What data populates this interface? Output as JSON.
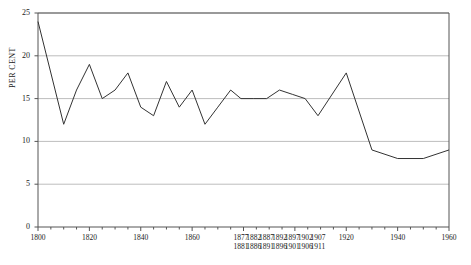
{
  "chart_data": {
    "type": "line",
    "title": "",
    "xlabel": "",
    "ylabel": "PER CENT",
    "ylim": [
      0,
      25
    ],
    "xlim": [
      1800,
      1960
    ],
    "grid": true,
    "legend": "none",
    "y_ticks": [
      0,
      5,
      10,
      15,
      20,
      25
    ],
    "y_tick_labels": [
      "0",
      "5",
      "10",
      "15",
      "20",
      "25"
    ],
    "x_tick_labels": [
      {
        "line1": "1800",
        "line2": "",
        "x": 1800
      },
      {
        "line1": "1820",
        "line2": "",
        "x": 1820
      },
      {
        "line1": "1840",
        "line2": "",
        "x": 1840
      },
      {
        "line1": "1860",
        "line2": "",
        "x": 1860
      },
      {
        "line1": "1877",
        "line2": "1881",
        "x": 1879
      },
      {
        "line1": "1882",
        "line2": "1886",
        "x": 1884
      },
      {
        "line1": "1887",
        "line2": "1891",
        "x": 1889
      },
      {
        "line1": "1892",
        "line2": "1896",
        "x": 1894
      },
      {
        "line1": "1897",
        "line2": "1901",
        "x": 1899
      },
      {
        "line1": "1902",
        "line2": "1906",
        "x": 1904
      },
      {
        "line1": "1907",
        "line2": "1911",
        "x": 1909
      },
      {
        "line1": "1920",
        "line2": "",
        "x": 1920
      },
      {
        "line1": "1940",
        "line2": "",
        "x": 1940
      },
      {
        "line1": "1960",
        "line2": "",
        "x": 1960
      }
    ],
    "x": [
      1800,
      1810,
      1815,
      1820,
      1825,
      1830,
      1835,
      1840,
      1845,
      1850,
      1855,
      1860,
      1865,
      1870,
      1875,
      1879,
      1884,
      1889,
      1894,
      1899,
      1904,
      1909,
      1920,
      1930,
      1940,
      1950,
      1960
    ],
    "values": [
      24,
      12,
      16,
      19,
      15,
      16,
      18,
      14,
      13,
      17,
      14,
      16,
      12,
      14,
      16,
      15,
      15,
      15,
      16,
      15.5,
      15,
      13,
      18,
      9,
      8,
      8,
      9
    ],
    "series": [
      {
        "name": "per cent",
        "color": "#333333",
        "values": [
          24,
          12,
          16,
          19,
          15,
          16,
          18,
          14,
          13,
          17,
          14,
          16,
          12,
          14,
          16,
          15,
          15,
          15,
          16,
          15.5,
          15,
          13,
          18,
          9,
          8,
          8,
          9
        ]
      }
    ],
    "gridline_color": "#bdbdbd",
    "axis_color": "#555555",
    "line_color": "#333333"
  }
}
